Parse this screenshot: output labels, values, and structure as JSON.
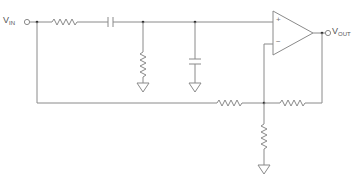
{
  "diagram": {
    "type": "circuit-schematic",
    "title": "",
    "input": {
      "label": "V",
      "subscript": "IN"
    },
    "output": {
      "label": "V",
      "subscript": "OUT"
    },
    "opamp": {
      "plus_label": "+",
      "minus_label": "−"
    },
    "components": [
      {
        "id": "R1",
        "type": "resistor",
        "orientation": "horizontal",
        "position": "series input"
      },
      {
        "id": "C1",
        "type": "capacitor",
        "orientation": "horizontal",
        "position": "series after R1"
      },
      {
        "id": "R2",
        "type": "resistor",
        "orientation": "vertical",
        "position": "shunt to ground"
      },
      {
        "id": "C2",
        "type": "capacitor",
        "orientation": "vertical",
        "position": "shunt to ground"
      },
      {
        "id": "R3",
        "type": "resistor",
        "orientation": "horizontal",
        "position": "feed from VIN to inverting node"
      },
      {
        "id": "R4",
        "type": "resistor",
        "orientation": "horizontal",
        "position": "feedback from output"
      },
      {
        "id": "R5",
        "type": "resistor",
        "orientation": "vertical",
        "position": "inverting node to ground"
      },
      {
        "id": "U1",
        "type": "op-amp"
      }
    ],
    "grounds": 3
  }
}
